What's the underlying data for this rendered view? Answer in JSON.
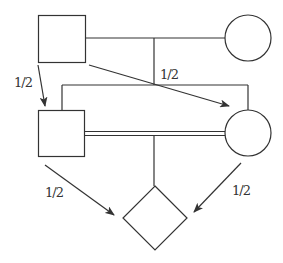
{
  "diagram": {
    "type": "pedigree",
    "colors": {
      "stroke": "#333333",
      "background": "#ffffff"
    },
    "nodes": [
      {
        "id": "grandfather",
        "shape": "square",
        "sex": "male",
        "x": 38,
        "y": 15,
        "size": 47
      },
      {
        "id": "grandmother",
        "shape": "circle",
        "sex": "female",
        "cx": 248,
        "cy": 38,
        "r": 23
      },
      {
        "id": "son",
        "shape": "square",
        "sex": "male",
        "x": 38,
        "y": 110,
        "size": 46
      },
      {
        "id": "daughter",
        "shape": "circle",
        "sex": "female",
        "cx": 248,
        "cy": 133,
        "r": 23
      },
      {
        "id": "offspring",
        "shape": "diamond",
        "sex": "unknown",
        "cx": 155,
        "cy": 218,
        "half": 32
      }
    ],
    "relationships": [
      {
        "type": "mating",
        "from": "grandfather",
        "to": "grandmother"
      },
      {
        "type": "consanguineous-mating",
        "from": "son",
        "to": "daughter"
      },
      {
        "type": "sibship",
        "members": [
          "son",
          "daughter"
        ]
      },
      {
        "type": "descent",
        "parents": [
          "son",
          "daughter"
        ],
        "child": "offspring"
      }
    ],
    "arrows": [
      {
        "id": "gf-to-son",
        "from": "grandfather",
        "to": "son",
        "label": "1/2"
      },
      {
        "id": "gf-to-daughter",
        "from": "grandfather",
        "to": "daughter",
        "label": "1/2"
      },
      {
        "id": "son-to-offspring",
        "from": "son",
        "to": "offspring",
        "label": "1/2"
      },
      {
        "id": "daughter-to-offspring",
        "from": "daughter",
        "to": "offspring",
        "label": "1/2"
      }
    ],
    "labels": {
      "gf_to_son": "1/2",
      "gf_to_daughter": "1/2",
      "son_to_offspring": "1/2",
      "daughter_to_offspring": "1/2"
    }
  }
}
